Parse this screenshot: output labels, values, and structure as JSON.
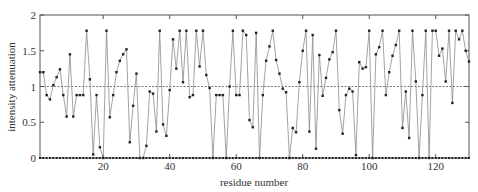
{
  "chart_data": {
    "type": "line",
    "title": "",
    "xlabel": "residue number",
    "ylabel": "intensity attenuation",
    "xlim": [
      1,
      130
    ],
    "ylim": [
      0,
      2
    ],
    "xticks": [
      20,
      40,
      60,
      80,
      100,
      120
    ],
    "yticks": [
      0,
      0.5,
      1,
      1.5,
      2
    ],
    "ytick_labels": [
      "0",
      "0.5",
      "1",
      "1.5",
      "2"
    ],
    "xtick_labels": [
      "20",
      "40",
      "60",
      "80",
      "100",
      "120"
    ],
    "reference_line": {
      "y": 1,
      "style": "dashed"
    },
    "baseline_markers": {
      "y": 0,
      "from": 1,
      "to": 130
    },
    "legend": "none",
    "grid": false,
    "colors": {
      "line": "#8a8a8a",
      "marker": "#222222",
      "axis": "#555555",
      "reference": "#555555"
    },
    "series": [
      {
        "name": "attenuation",
        "x": [
          1,
          2,
          3,
          4,
          5,
          6,
          7,
          8,
          9,
          10,
          11,
          12,
          13,
          14,
          15,
          16,
          17,
          18,
          19,
          20,
          21,
          22,
          23,
          24,
          25,
          26,
          27,
          28,
          29,
          30,
          31,
          32,
          33,
          34,
          35,
          36,
          37,
          38,
          39,
          40,
          41,
          42,
          43,
          44,
          45,
          46,
          47,
          48,
          49,
          50,
          51,
          52,
          53,
          54,
          55,
          56,
          57,
          58,
          59,
          60,
          61,
          62,
          63,
          64,
          65,
          66,
          67,
          68,
          69,
          70,
          71,
          72,
          73,
          74,
          75,
          76,
          77,
          78,
          79,
          80,
          81,
          82,
          83,
          84,
          85,
          86,
          87,
          88,
          89,
          90,
          91,
          92,
          93,
          94,
          95,
          96,
          97,
          98,
          99,
          100,
          101,
          102,
          103,
          104,
          105,
          106,
          107,
          108,
          109,
          110,
          111,
          112,
          113,
          114,
          115,
          116,
          117,
          118,
          119,
          120,
          121,
          122,
          123,
          124,
          125,
          126,
          127,
          128,
          129,
          130
        ],
        "values": [
          1.2,
          1.2,
          0.88,
          0.82,
          1.02,
          1.13,
          1.24,
          0.88,
          0.58,
          1.45,
          0.58,
          0.88,
          0.88,
          0.88,
          1.78,
          1.1,
          0.05,
          0.88,
          0.15,
          0.0,
          1.78,
          0.57,
          0.88,
          1.2,
          1.36,
          1.45,
          1.52,
          0.22,
          0.73,
          1.18,
          0.0,
          0.0,
          0.17,
          0.93,
          0.9,
          0.37,
          1.78,
          0.47,
          0.31,
          0.95,
          1.66,
          1.25,
          1.78,
          1.06,
          1.78,
          0.85,
          0.88,
          1.78,
          1.28,
          1.78,
          1.16,
          0.98,
          0.0,
          0.88,
          0.88,
          0.88,
          0.0,
          1.0,
          1.78,
          0.88,
          0.88,
          1.78,
          1.72,
          0.53,
          0.43,
          1.75,
          0.0,
          0.88,
          1.36,
          1.56,
          1.78,
          1.37,
          1.18,
          0.97,
          0.92,
          0.0,
          0.42,
          0.36,
          1.06,
          1.5,
          1.78,
          0.37,
          1.72,
          0.13,
          1.44,
          0.87,
          1.12,
          1.38,
          1.48,
          1.78,
          0.67,
          0.34,
          0.88,
          0.97,
          0.93,
          0.04,
          1.34,
          1.25,
          1.27,
          1.78,
          0.0,
          1.45,
          1.55,
          1.78,
          0.88,
          1.2,
          1.43,
          1.58,
          1.78,
          0.42,
          0.93,
          0.28,
          1.78,
          1.07,
          0.0,
          0.88,
          1.78,
          0.0,
          1.78,
          1.78,
          1.43,
          1.53,
          1.07,
          1.78,
          0.77,
          1.78,
          1.66,
          1.78,
          1.5,
          1.35
        ]
      }
    ]
  }
}
